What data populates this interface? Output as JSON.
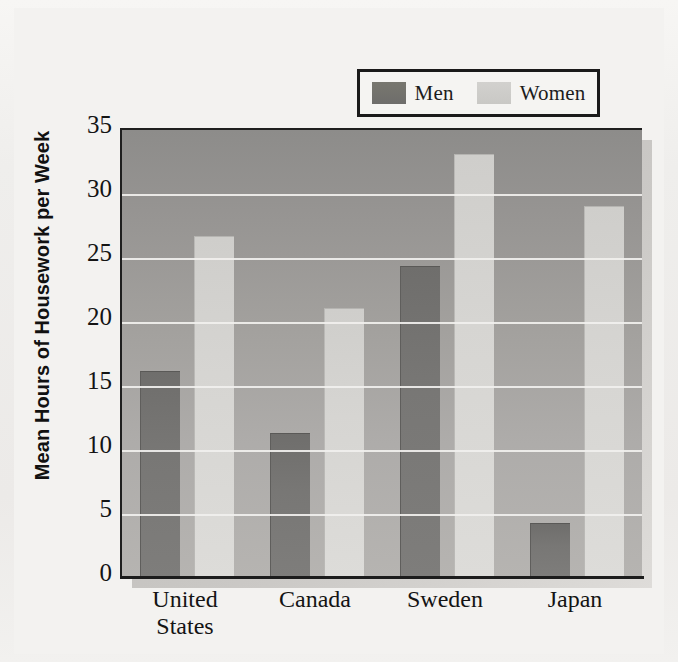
{
  "chart_data": {
    "type": "bar",
    "title": "",
    "subtitle": "",
    "xlabel": "",
    "ylabel": "Mean Hours of Housework per Week",
    "ylim": [
      0,
      35
    ],
    "yticks": [
      0,
      5,
      10,
      15,
      20,
      25,
      30,
      35
    ],
    "ytick_labels": [
      "0",
      "5",
      "10",
      "15",
      "20",
      "25",
      "30",
      "35"
    ],
    "grid": true,
    "grid_axis": "y",
    "legend_position": "top-right",
    "categories": [
      "United States",
      "Canada",
      "Sweden",
      "Japan"
    ],
    "category_lines": [
      [
        "United",
        "States"
      ],
      [
        "Canada"
      ],
      [
        "Sweden"
      ],
      [
        "Japan"
      ]
    ],
    "series": [
      {
        "name": "Men",
        "color": "#78776f",
        "values": [
          16.2,
          11.3,
          24.4,
          4.3
        ]
      },
      {
        "name": "Women",
        "color": "#d6d5d2",
        "values": [
          26.7,
          21.1,
          33.1,
          29.1
        ]
      }
    ]
  },
  "legend": {
    "entries": [
      {
        "label": "Men",
        "swatch_color": "#78776f"
      },
      {
        "label": "Women",
        "swatch_color": "#d2d1ce"
      }
    ]
  },
  "colors": {
    "page_background": "#f0efed",
    "plot_background_top": "#8d8c8a",
    "plot_background_bottom": "#b6b4b1",
    "gridline": "#f1f0ee",
    "axis": "#1c1c1c",
    "text": "#141414",
    "men_bar": "#78776f",
    "women_bar": "#d6d5d2"
  }
}
